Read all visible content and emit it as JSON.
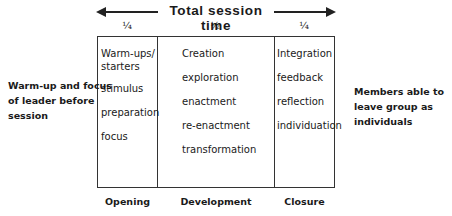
{
  "header": {
    "title": "Total session time",
    "fractions": [
      "¼",
      "½",
      "¼"
    ]
  },
  "left_note": {
    "lines": [
      "Warm-up and focus",
      "of leader before",
      "session"
    ]
  },
  "right_note": {
    "lines": [
      "Members able to",
      "leave group as",
      "individuals"
    ]
  },
  "columns": [
    {
      "label": "Opening",
      "fraction": "¼",
      "items": [
        "Warm-ups/",
        "starters",
        "stimulus",
        "preparation",
        "focus"
      ]
    },
    {
      "label": "Development",
      "fraction": "½",
      "items": [
        "Creation",
        "exploration",
        "enactment",
        "re-enactment",
        "transformation"
      ]
    },
    {
      "label": "Closure",
      "fraction": "¼",
      "items": [
        "Integration",
        "feedback",
        "reflection",
        "individuation"
      ]
    }
  ],
  "colors": {
    "line": "#333333",
    "text": "#1a1a1a",
    "background": "#ffffff"
  }
}
